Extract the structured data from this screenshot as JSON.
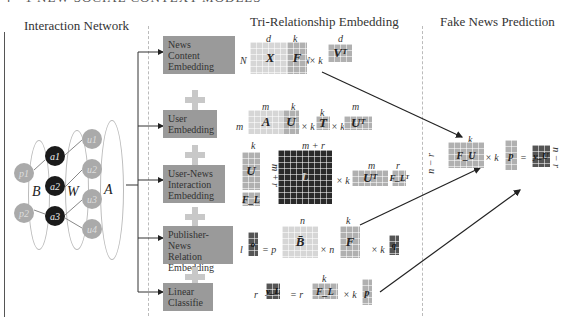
{
  "top_caption": "4 · 1 NEW SOCIAL CONTEXT MODELS",
  "sections": {
    "interaction_network": "Interaction Network",
    "tri_relationship": "Tri-Relationship Embedding",
    "prediction": "Fake News Prediction"
  },
  "network": {
    "publishers": [
      "p1",
      "p2"
    ],
    "news": [
      "a1",
      "a2",
      "a3"
    ],
    "users": [
      "u1",
      "u2",
      "u3",
      "u4"
    ],
    "labels": {
      "B": "B",
      "W": "W",
      "A": "A"
    }
  },
  "components": [
    {
      "label": "News Content Embedding",
      "lines": [
        "News",
        "Content",
        "Embedding"
      ]
    },
    {
      "label": "User Embedding",
      "lines": [
        "User",
        "Embedding"
      ]
    },
    {
      "label": "User-News Interaction Embedding",
      "lines": [
        "User-News",
        "Interaction",
        "Embedding"
      ]
    },
    {
      "label": "Publisher-News Relation Embedding",
      "lines": [
        "Publisher-News",
        "Relation",
        "Embedding"
      ]
    },
    {
      "label": "Linear Classifie",
      "lines": [
        "Linear",
        "Classifie"
      ]
    }
  ],
  "equations": {
    "news": {
      "lhs_rows": "N",
      "X": "X",
      "X_cols": "d",
      "eq": "= N",
      "F": "F",
      "F_cols": "k",
      "times": "× k",
      "VT": "Vᵀ",
      "VT_cols": "d"
    },
    "user": {
      "lhs_rows": "m",
      "A": "A",
      "A_cols": "m",
      "eq": "= m",
      "U": "U",
      "U_cols": "k",
      "times1": "× k",
      "T": "T",
      "T_cols": "k",
      "times2": "× k",
      "UT": "Uᵀ",
      "UT_cols": "m"
    },
    "interaction": {
      "U": "U",
      "FL": "F_L",
      "U_cols": "k",
      "rows": "m + r",
      "L": "L",
      "L_cols": "m + r",
      "times": "× k",
      "UT": "Uᵀ",
      "UT_cols": "m",
      "FLT": "F_Lᵀ",
      "FLT_cols": "r"
    },
    "publisher": {
      "lhs_rows": "l",
      "o": "o",
      "eq": "= p",
      "B": "B̄",
      "B_cols": "n",
      "times1": "× n",
      "F": "F",
      "F_cols": "k",
      "times2": "× k",
      "q": "q"
    },
    "classifier": {
      "lhs_rows": "r",
      "yL": "y_L",
      "eq": "= r",
      "FL": "F_L",
      "FL_cols": "k",
      "times": "× k",
      "p": "p"
    }
  },
  "prediction": {
    "rows_left": "n − r",
    "FU": "F_U",
    "FU_cols": "k",
    "times": "× k",
    "p": "p",
    "eq": "=",
    "yU": "y_U",
    "rows_right": "n − r"
  },
  "colors": {
    "box": "#9a9a9a",
    "light_matrix": "#d6d6d6",
    "mid_matrix": "#b0b0b0",
    "dark_matrix": "#2a2a2a",
    "plus": "#c8c8c8"
  }
}
